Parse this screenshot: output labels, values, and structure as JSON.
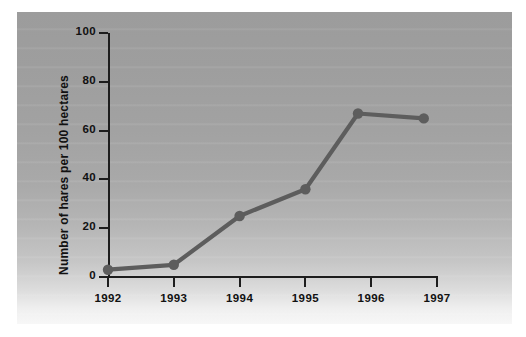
{
  "chart_data": {
    "type": "line",
    "title": "",
    "subtitle": "",
    "xlabel": "",
    "ylabel": "Number of hares per 100 hectares",
    "x": [
      1992,
      1993,
      1994,
      1995,
      1995.8,
      1996.8
    ],
    "categories": [
      "1992",
      "1993",
      "1994",
      "1995",
      "1996",
      "1997"
    ],
    "values": [
      3,
      5,
      25,
      36,
      67,
      65
    ],
    "series": [
      {
        "name": "Number of hares per 100 hectares",
        "values": [
          3,
          5,
          25,
          36,
          67,
          65
        ]
      }
    ],
    "points": [
      {
        "x": 1992.0,
        "y": 3
      },
      {
        "x": 1993.0,
        "y": 5
      },
      {
        "x": 1994.0,
        "y": 25
      },
      {
        "x": 1995.0,
        "y": 36
      },
      {
        "x": 1995.8,
        "y": 67
      },
      {
        "x": 1996.8,
        "y": 65
      }
    ],
    "xtick_labels": [
      "1992",
      "1993",
      "1994",
      "1995",
      "1996",
      "1997"
    ],
    "ytick_labels": [
      "0",
      "20",
      "40",
      "60",
      "80",
      "100"
    ],
    "ytick_values": [
      0,
      20,
      40,
      60,
      80,
      100
    ],
    "xlim": [
      1992,
      1997
    ],
    "ylim": [
      0,
      100
    ],
    "grid": false,
    "legend": "none",
    "marker": "circle",
    "line_color": "#5d5d5d",
    "marker_color": "#5d5d5d",
    "axis_color": "#1d1d1d",
    "panel_background": "#a6a6a6",
    "page_background": "#ffffff"
  }
}
